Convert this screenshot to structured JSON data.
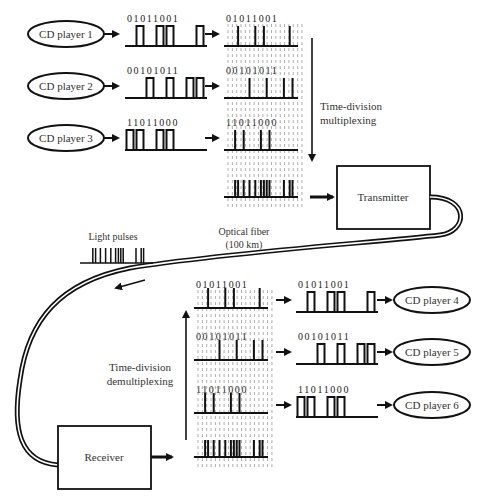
{
  "inputs": [
    {
      "label": "CD player 1",
      "bits": "01011001"
    },
    {
      "label": "CD player 2",
      "bits": "00101011"
    },
    {
      "label": "CD player 3",
      "bits": "11011000"
    }
  ],
  "outputs": [
    {
      "label": "CD player 4",
      "bits": "01011001"
    },
    {
      "label": "CD player 5",
      "bits": "00101011"
    },
    {
      "label": "CD player 6",
      "bits": "11011000"
    }
  ],
  "labels": {
    "mux_line1": "Time-division",
    "mux_line2": "multiplexing",
    "demux_line1": "Time-division",
    "demux_line2": "demultiplexing",
    "transmitter": "Transmitter",
    "receiver": "Receiver",
    "fiber_line1": "Optical fiber",
    "fiber_line2": "(100 km)",
    "light_pulses": "Light pulses"
  },
  "colors": {
    "stroke": "#111111",
    "text": "#333333",
    "grid": "#999999",
    "background": "#ffffff"
  }
}
